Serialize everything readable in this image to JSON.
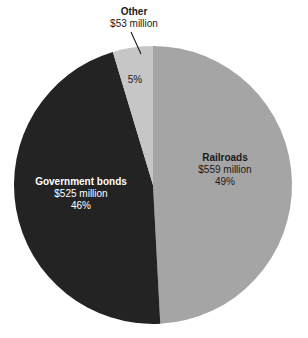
{
  "chart_data": {
    "type": "pie",
    "title": "",
    "subtitle": "",
    "categories": [
      "Railroads",
      "Government bonds",
      "Other"
    ],
    "values": [
      559,
      525,
      53
    ],
    "percentages": [
      49,
      46,
      5
    ],
    "value_unit": "$ million",
    "legend_position": "none",
    "grid": false,
    "labels_inside": true,
    "start_angle_deg": 0,
    "direction": "clockwise",
    "slices": [
      {
        "name": "Railroads",
        "amount_label": "$559 million",
        "percent_label": "49%",
        "value": 559,
        "percent": 49,
        "color": "#a5a5a5",
        "text_color": "#1a1a1a",
        "label_placement": "inside"
      },
      {
        "name": "Government bonds",
        "amount_label": "$525 million",
        "percent_label": "46%",
        "value": 525,
        "percent": 46,
        "color": "#232323",
        "text_color": "#ffffff",
        "label_placement": "inside"
      },
      {
        "name": "Other",
        "amount_label": "$53 million",
        "percent_label": "5%",
        "value": 53,
        "percent": 5,
        "color": "#c6c6c6",
        "text_color": "#1a1a1a",
        "label_placement": "callout"
      }
    ],
    "colors": {
      "railroads": "#a5a5a5",
      "government_bonds": "#232323",
      "other": "#c6c6c6",
      "background": "#ffffff",
      "leader_line": "#1a1a1a"
    }
  },
  "labels": {
    "other": {
      "name": "Other",
      "amount": "$53 million",
      "percent": "5%"
    },
    "railroads": {
      "name": "Railroads",
      "amount": "$559 million",
      "percent": "49%"
    },
    "government_bonds": {
      "name": "Government bonds",
      "amount": "$525 million",
      "percent": "46%"
    }
  }
}
